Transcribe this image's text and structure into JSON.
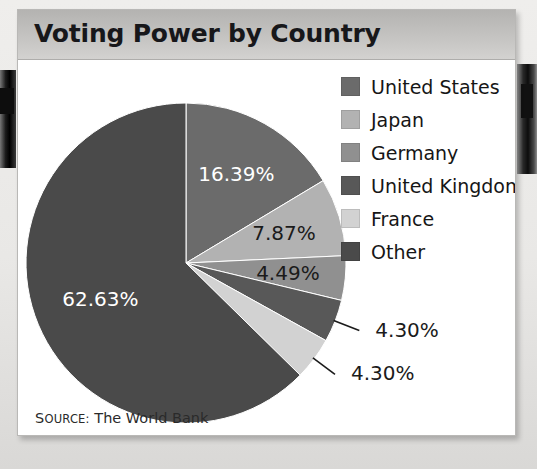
{
  "card": {
    "title": "Voting Power by Country",
    "source_prefix": "S",
    "source_label": "OURCE:",
    "source_text": "The World Bank"
  },
  "chart_data": {
    "type": "pie",
    "title": "Voting Power by Country",
    "xlabel": "",
    "ylabel": "",
    "grid": false,
    "legend_position": "right",
    "units": "percent",
    "start_angle_deg": 0,
    "direction": "clockwise",
    "categories": [
      "United States",
      "Japan",
      "Germany",
      "United Kingdom",
      "France",
      "Other"
    ],
    "values": [
      16.39,
      7.87,
      4.49,
      4.3,
      4.3,
      62.63
    ],
    "value_labels": [
      "16.39%",
      "7.87%",
      "4.49%",
      "4.30%",
      "4.30%",
      "62.63%"
    ],
    "colors": [
      "#6b6b6b",
      "#b2b2b2",
      "#909090",
      "#585858",
      "#d2d2d2",
      "#4a4a4a"
    ],
    "label_colors": [
      "#ffffff",
      "#1b1b1b",
      "#1b1b1b",
      "#1b1b1b",
      "#1b1b1b",
      "#ffffff"
    ],
    "label_placement": [
      "inside",
      "inside",
      "inside",
      "outside",
      "outside",
      "inside"
    ],
    "slices": [
      {
        "name": "United States",
        "value": 16.39,
        "label": "16.39%",
        "color": "#6b6b6b",
        "label_color": "#ffffff",
        "placement": "inside"
      },
      {
        "name": "Japan",
        "value": 7.87,
        "label": "7.87%",
        "color": "#b2b2b2",
        "label_color": "#1b1b1b",
        "placement": "inside"
      },
      {
        "name": "Germany",
        "value": 4.49,
        "label": "4.49%",
        "color": "#909090",
        "label_color": "#1b1b1b",
        "placement": "inside"
      },
      {
        "name": "United Kingdom",
        "value": 4.3,
        "label": "4.30%",
        "color": "#585858",
        "label_color": "#1b1b1b",
        "placement": "outside"
      },
      {
        "name": "France",
        "value": 4.3,
        "label": "4.30%",
        "color": "#d2d2d2",
        "label_color": "#1b1b1b",
        "placement": "outside"
      },
      {
        "name": "Other",
        "value": 62.63,
        "label": "62.63%",
        "color": "#4a4a4a",
        "label_color": "#ffffff",
        "placement": "inside"
      }
    ]
  },
  "legend": {
    "items": [
      {
        "label": "United States",
        "color": "#6b6b6b"
      },
      {
        "label": "Japan",
        "color": "#b2b2b2"
      },
      {
        "label": "Germany",
        "color": "#909090"
      },
      {
        "label": "United Kingdom",
        "color": "#585858"
      },
      {
        "label": "France",
        "color": "#d2d2d2"
      },
      {
        "label": "Other",
        "color": "#4a4a4a"
      }
    ]
  },
  "theme": {
    "card_bg": "#ffffff",
    "title_band_top": "#b4b3b1",
    "title_band_bottom": "#d3d2d0",
    "page_bg": "#ecebe9",
    "text": "#17171a"
  }
}
